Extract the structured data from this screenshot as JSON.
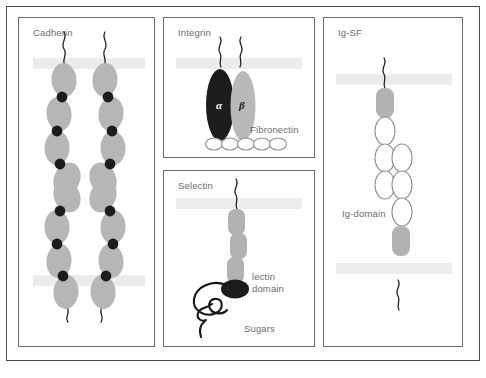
{
  "figure": {
    "type": "cell-adhesion-molecule-diagram",
    "background": "#ffffff",
    "panel_border_color": "#6d6d6d",
    "membrane_color": "#ececec",
    "label_color": "#6b6b6b"
  },
  "panels": {
    "cadherin": {
      "title": "Cadherin",
      "domain_color": "#b6b6b6",
      "calcium_color": "#1c1c1c",
      "description": "Two mirrored cadherin chains of four extracellular domains each, joined by black calcium-binding sites, spanning two opposed membranes"
    },
    "integrin": {
      "title": "Integrin",
      "alpha_label": "α",
      "beta_label": "β",
      "ligand_label": "Fibronectin",
      "alpha_color": "#1c1c1c",
      "beta_color": "#b9b9b9",
      "fibronectin_units": 5
    },
    "selectin": {
      "title": "Selectin",
      "lectin_label_line1": "lectin",
      "lectin_label_line2": "domain",
      "sugars_label": "Sugars",
      "domain_color": "#b2b2b2",
      "lectin_color": "#1c1c1c",
      "repeat_domains": 3
    },
    "igsf": {
      "title": "Ig-SF",
      "domain_label": "Ig-domain",
      "membrane_domain_color": "#b2b2b2",
      "ig_domain_fill": "#ffffff",
      "ig_domain_stroke": "#8e8e8e",
      "ig_domains_per_chain": 3
    }
  }
}
